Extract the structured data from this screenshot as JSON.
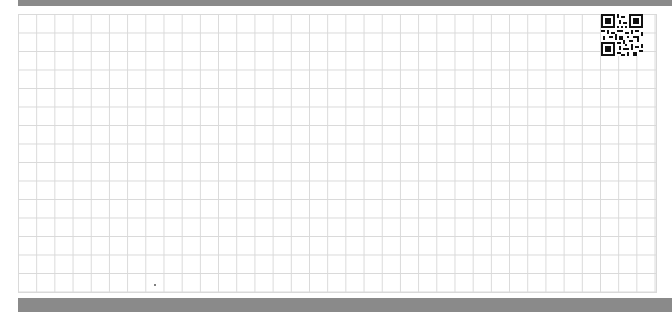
{
  "page": {
    "type": "grid-paper",
    "background_color": "#ffffff",
    "grid_line_color": "#d9d9d9",
    "bar_color": "#8a8a8a"
  },
  "qr_code": {
    "icon": "qr-code-icon",
    "position": "top-right"
  }
}
